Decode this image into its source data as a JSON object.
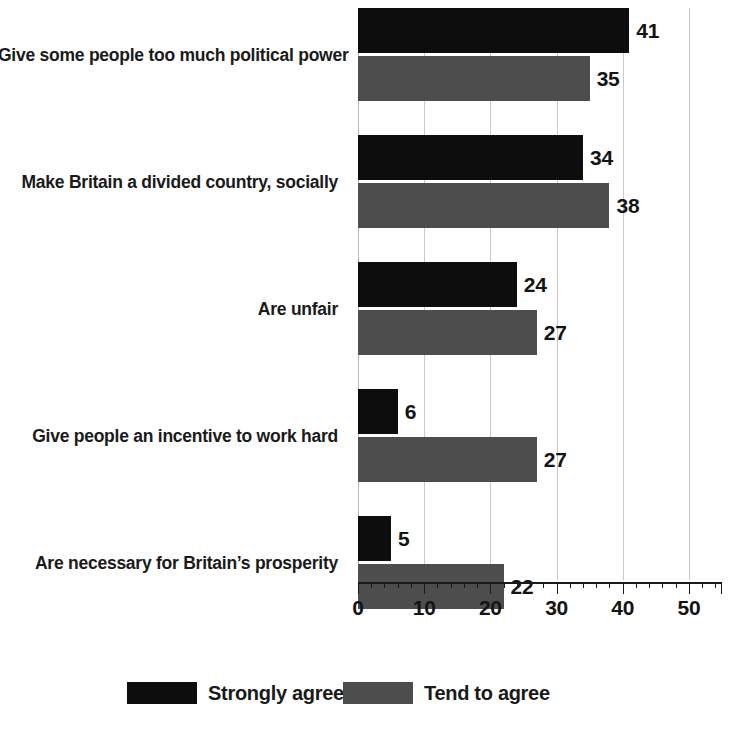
{
  "chart_data": {
    "type": "bar",
    "orientation": "horizontal",
    "title": "",
    "subtitle": "",
    "xlabel": "",
    "ylabel": "",
    "xlim": [
      0,
      55
    ],
    "xticks": [
      0,
      10,
      20,
      30,
      40,
      50
    ],
    "xtick_labels": [
      "0",
      "10",
      "20",
      "30",
      "40",
      "50"
    ],
    "minor_tick_step": 2,
    "grid": "vertical",
    "legend_position": "bottom",
    "categories": [
      "Give some people too much political power",
      "Make Britain a divided country, socially",
      "Are unfair",
      "Give people an incentive to work hard",
      "Are necessary for Britain’s prosperity"
    ],
    "series": [
      {
        "name": "Strongly agree",
        "color": "#0d0d0d",
        "values": [
          41,
          34,
          24,
          6,
          5
        ]
      },
      {
        "name": "Tend to agree",
        "color": "#4d4d4d",
        "values": [
          35,
          38,
          27,
          27,
          22
        ]
      }
    ]
  },
  "legend": {
    "items": [
      {
        "label": "Strongly agree",
        "swatch": "series-strongly"
      },
      {
        "label": "Tend to agree",
        "swatch": "series-tend"
      }
    ]
  },
  "colors": {
    "strongly_agree": "#0d0d0d",
    "tend_to_agree": "#4d4d4d",
    "gridline": "#c9c9c9",
    "axis": "#1a1a1a",
    "text": "#1a1a1a",
    "background": "#ffffff"
  }
}
